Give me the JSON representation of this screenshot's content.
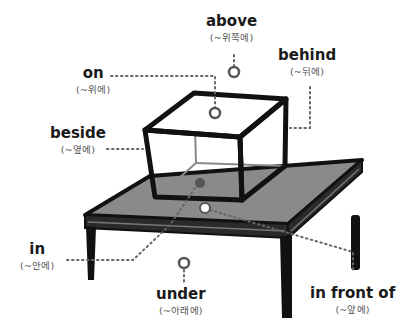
{
  "diagram": {
    "labels": [
      {
        "id": "above",
        "en": "above",
        "ko": "(~위쪽에)"
      },
      {
        "id": "on",
        "en": "on",
        "ko": "(~위에)"
      },
      {
        "id": "behind",
        "en": "behind",
        "ko": "(~뒤에)"
      },
      {
        "id": "beside",
        "en": "beside",
        "ko": "(~옆에)"
      },
      {
        "id": "in",
        "en": "in",
        "ko": "(~안에)"
      },
      {
        "id": "under",
        "en": "under",
        "ko": "(~아래에)"
      },
      {
        "id": "in_front_of",
        "en": "in front of",
        "ko": "(~앞에)"
      }
    ],
    "colors": {
      "outline": "#111111",
      "table_top": "#8a8a8a",
      "box_inner_edges": "#777777",
      "dotted_leader": "#666666",
      "marker_ring": "#555555"
    }
  }
}
